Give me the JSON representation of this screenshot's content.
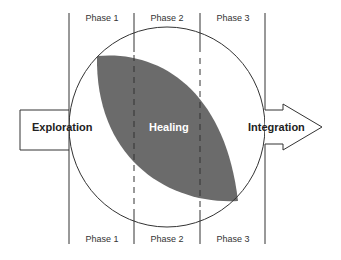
{
  "diagram": {
    "phases_top": [
      "Phase 1",
      "Phase 2",
      "Phase 3"
    ],
    "phases_bottom": [
      "Phase 1",
      "Phase 2",
      "Phase 3"
    ],
    "left_label": "Exploration",
    "center_label": "Healing",
    "right_label": "Integration",
    "colors": {
      "leaf_fill": "#6b6b6b",
      "line": "#333333",
      "background": "#ffffff"
    }
  }
}
